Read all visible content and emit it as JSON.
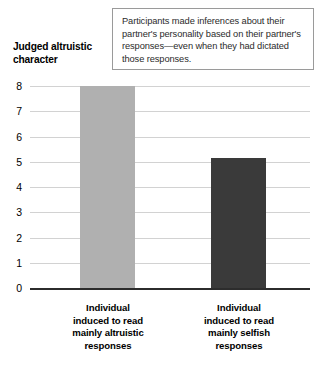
{
  "annotation": {
    "text": "Participants made inferences about their partner's personality based on their partner's responses—even when they had dictated those responses."
  },
  "chart_data": {
    "type": "bar",
    "title": "",
    "ylabel": "Judged altruistic character",
    "xlabel": "",
    "ylim": [
      0,
      8
    ],
    "grid": true,
    "legend": "none",
    "y_ticks": [
      "8",
      "7",
      "6",
      "5",
      "4",
      "3",
      "2",
      "1",
      "0"
    ],
    "categories": [
      "Individual induced to read mainly altruistic responses",
      "Individual induced to read mainly selfish responses"
    ],
    "category_lines": [
      [
        "Individual",
        "induced to read",
        "mainly altruistic",
        "responses"
      ],
      [
        "Individual",
        "induced to read",
        "mainly selfish",
        "responses"
      ]
    ],
    "values": [
      8.0,
      5.15
    ],
    "bar_colors": [
      "#b0b0b0",
      "#3a3a3a"
    ],
    "annotation_note": "Participants made inferences about their partner's personality based on their partner's responses—even when they had dictated those responses."
  },
  "colors": {
    "bar_altruistic": "#b0b0b0",
    "bar_selfish": "#3a3a3a",
    "gridline": "#d2d2d2",
    "axis": "#2c2c2c",
    "box_border": "#9a9a9a",
    "text": "#000000"
  }
}
